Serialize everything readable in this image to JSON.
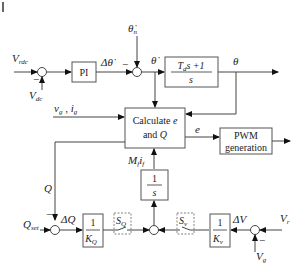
{
  "diagram": {
    "type": "control block diagram",
    "inputs": {
      "vrdc": {
        "main": "V",
        "sub": "rdc"
      },
      "vdc": {
        "main": "V",
        "sub": "dc"
      },
      "theta_n": {
        "main": "θ̇",
        "sub": "n"
      },
      "vg_ig": {
        "text1": "v",
        "sub1": "g",
        "sep": " , ",
        "text2": "i",
        "sub2": "g"
      },
      "qset": {
        "main": "Q",
        "sub": "set"
      },
      "vr": {
        "main": "V",
        "sub": "r"
      },
      "vg": {
        "main": "V",
        "sub": "g"
      }
    },
    "signals": {
      "delta_theta_dot": "Δθ̇",
      "theta_dot": "θ̇",
      "theta": "θ",
      "e": "e",
      "q": "Q",
      "mf_if": {
        "m": "M",
        "msub": "f",
        "i": "i",
        "isub": "f"
      },
      "delta_q": "ΔQ",
      "delta_v": "ΔV"
    },
    "blocks": {
      "pi": "PI",
      "td": {
        "num_a": "T",
        "num_sub": "d",
        "num_b": "s +1",
        "den": "s"
      },
      "calc": {
        "line1": "Calculate ",
        "line1_var": "e",
        "line2": "and ",
        "line2_var": "Q"
      },
      "pwm": {
        "line1": "PWM",
        "line2": "generation"
      },
      "integrator": {
        "num": "1",
        "den": "s"
      },
      "kq": {
        "num": "1",
        "den": "K",
        "den_sub": "Q"
      },
      "kv": {
        "num": "1",
        "den": "K",
        "den_sub": "v"
      },
      "sq": {
        "main": "S",
        "sub": "Q"
      },
      "sv": {
        "main": "S",
        "sub": "v"
      }
    },
    "signs": {
      "minus": "−"
    }
  }
}
